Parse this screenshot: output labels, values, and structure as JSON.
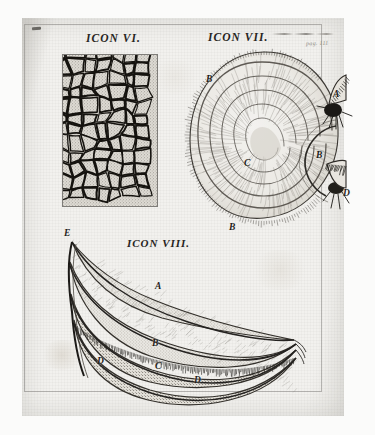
{
  "plate": {
    "type": "antique-engraving-plate",
    "medium": "copperplate engraving on laid paper",
    "page_note": "pag. 111",
    "paper_color": "#f2f1ee",
    "ink_color": "#272522"
  },
  "figures": [
    {
      "id": "icon-vi",
      "caption": "ICON VI.",
      "subject": "reticulated cellular membrane",
      "description": "rectangular panel filled with dense irregular polygonal cells, stippled interiors, dark engraved outlines",
      "keys": []
    },
    {
      "id": "icon-vii",
      "caption": "ICON VII.",
      "subject": "spirally coiled organ with two fringed orifices",
      "description": "large rounded body wound in a flat spiral, finely hatched radiating fibres, two bristled openings at right",
      "keys": [
        {
          "label": "A",
          "x": 333,
          "y": 89,
          "note": "upper fringed orifice"
        },
        {
          "label": "B",
          "x": 206,
          "y": 74,
          "note": "outer whorl, upper"
        },
        {
          "label": "B",
          "x": 316,
          "y": 150,
          "note": "inner fold"
        },
        {
          "label": "B",
          "x": 229,
          "y": 222,
          "note": "outer whorl, lower"
        },
        {
          "label": "C",
          "x": 244,
          "y": 158,
          "note": "centre of the spiral"
        },
        {
          "label": "D",
          "x": 343,
          "y": 188,
          "note": "lower fringed orifice"
        }
      ]
    },
    {
      "id": "icon-viii",
      "caption": "ICON VIII.",
      "subject": "layered leaf-like lamellate structure",
      "description": "boat-shaped body of four stacked stippled laminae tapering to a point at the right, fringed lower margin",
      "keys": [
        {
          "label": "E",
          "x": 64,
          "y": 228,
          "note": "apex of the upper lamina"
        },
        {
          "label": "A",
          "x": 155,
          "y": 287,
          "note": "first lamina"
        },
        {
          "label": "B",
          "x": 152,
          "y": 344,
          "note": "second lamina"
        },
        {
          "label": "C",
          "x": 155,
          "y": 367,
          "note": "third lamina"
        },
        {
          "label": "D",
          "x": 97,
          "y": 362,
          "note": "fringed margin, left"
        },
        {
          "label": "D",
          "x": 194,
          "y": 381,
          "note": "fringed margin, lower"
        }
      ]
    }
  ]
}
